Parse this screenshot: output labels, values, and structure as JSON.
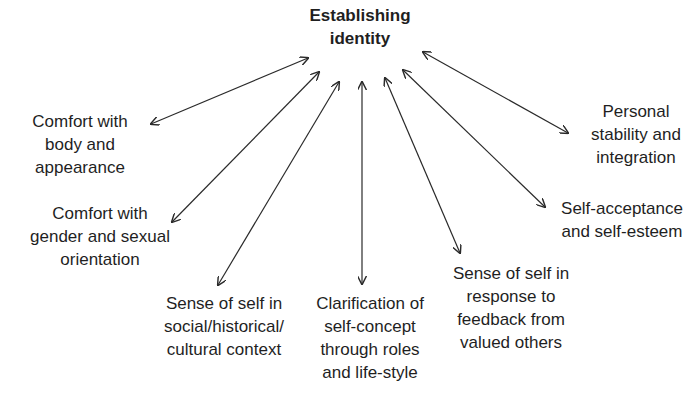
{
  "diagram": {
    "center": {
      "label": "Establishing\nidentity"
    },
    "nodes": [
      {
        "id": "body",
        "label": "Comfort with\nbody and\nappearance"
      },
      {
        "id": "gender",
        "label": "Comfort with\ngender and sexual\norientation"
      },
      {
        "id": "social",
        "label": "Sense of self in\nsocial/historical/\ncultural context"
      },
      {
        "id": "clarification",
        "label": "Clarification of\nself-concept\nthrough roles\nand life-style"
      },
      {
        "id": "feedback",
        "label": "Sense of self in\nresponse to\nfeedback from\nvalued others"
      },
      {
        "id": "acceptance",
        "label": "Self-acceptance\nand self-esteem"
      },
      {
        "id": "stability",
        "label": "Personal\nstability and\nintegration"
      }
    ],
    "edges": [
      {
        "from": "center",
        "to": "body",
        "type": "bidirectional"
      },
      {
        "from": "center",
        "to": "gender",
        "type": "bidirectional"
      },
      {
        "from": "center",
        "to": "social",
        "type": "bidirectional"
      },
      {
        "from": "center",
        "to": "clarification",
        "type": "bidirectional"
      },
      {
        "from": "center",
        "to": "feedback",
        "type": "bidirectional"
      },
      {
        "from": "center",
        "to": "acceptance",
        "type": "bidirectional"
      },
      {
        "from": "center",
        "to": "stability",
        "type": "bidirectional"
      }
    ],
    "colors": {
      "arrow": "#2a2a2a",
      "text": "#1f1f1f",
      "background": "#ffffff"
    }
  }
}
